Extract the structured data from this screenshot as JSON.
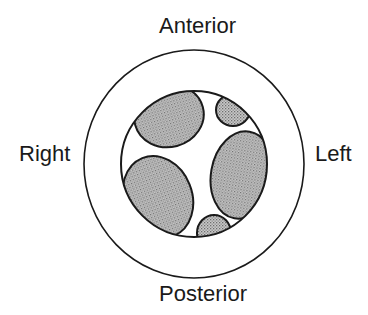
{
  "diagram": {
    "type": "anatomical cross-section schematic",
    "labels": {
      "top": "Anterior",
      "bottom": "Posterior",
      "left": "Right",
      "right": "Left"
    },
    "outer_ring": {
      "cx": 194,
      "cy": 164,
      "rx": 110,
      "ry": 114
    },
    "inner_circle": {
      "cx": 194,
      "cy": 164,
      "r": 73
    },
    "shaded_regions": [
      {
        "name": "anterior-right-region",
        "cx": 169,
        "cy": 116,
        "rx": 35,
        "ry": 31,
        "rotate": -15
      },
      {
        "name": "anterior-left-region",
        "cx": 233,
        "cy": 110,
        "rx": 17,
        "ry": 16,
        "rotate": 0
      },
      {
        "name": "left-lateral-region",
        "cx": 242,
        "cy": 175,
        "rx": 31,
        "ry": 44,
        "rotate": 10
      },
      {
        "name": "posterior-right-region",
        "cx": 158,
        "cy": 197,
        "rx": 34,
        "ry": 42,
        "rotate": -22
      },
      {
        "name": "posterior-left-region",
        "cx": 214,
        "cy": 233,
        "rx": 17,
        "ry": 18,
        "rotate": 0
      }
    ],
    "colors": {
      "stroke": "#1a1a1a",
      "fill_base": "#c4c4c4",
      "fill_dot": "#7a7a7a",
      "background": "#ffffff"
    }
  }
}
